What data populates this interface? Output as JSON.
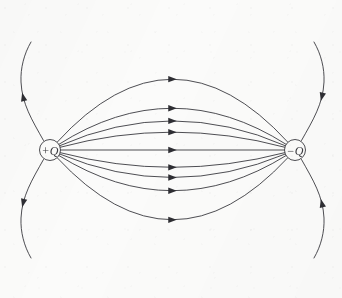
{
  "figure": {
    "name": "electric-dipole-field-lines",
    "background_color": "#fbfbfa",
    "ink_color": "#3a3a3f",
    "stroke_width": 0.9,
    "width": 342,
    "height": 298
  },
  "charges": {
    "positive": {
      "label": "+Q",
      "cx": 50,
      "cy": 150,
      "r": 10.5,
      "font_size": 12,
      "sign": "+",
      "name": "positive-charge"
    },
    "negative": {
      "label": "−Q",
      "cx": 295,
      "cy": 150,
      "r": 10.5,
      "font_size": 12,
      "sign": "−",
      "name": "negative-charge"
    }
  },
  "arrowhead": {
    "length": 8.5,
    "half_width": 3.2,
    "color": "#2e2e33"
  },
  "connecting_lines": [
    {
      "name": "arc-upper-4",
      "bulge": -134,
      "arrow_t": 0.5,
      "arrow_dir": "right"
    },
    {
      "name": "arc-upper-3",
      "bulge": -78,
      "arrow_t": 0.5,
      "arrow_dir": "right"
    },
    {
      "name": "arc-upper-2",
      "bulge": -54,
      "arrow_t": 0.5,
      "arrow_dir": "right"
    },
    {
      "name": "arc-upper-1",
      "bulge": -33,
      "arrow_t": 0.5,
      "arrow_dir": "right"
    },
    {
      "name": "arc-center",
      "bulge": 0,
      "arrow_t": 0.5,
      "arrow_dir": "right"
    },
    {
      "name": "arc-lower-1",
      "bulge": 32,
      "arrow_t": 0.5,
      "arrow_dir": "right"
    },
    {
      "name": "arc-lower-2",
      "bulge": 51,
      "arrow_t": 0.5,
      "arrow_dir": "right"
    },
    {
      "name": "arc-lower-3",
      "bulge": 76,
      "arrow_t": 0.5,
      "arrow_dir": "right"
    },
    {
      "name": "arc-lower-4",
      "bulge": 132,
      "arrow_t": 0.5,
      "arrow_dir": "right"
    }
  ],
  "outer_lines": [
    {
      "name": "outer-line-upper-left",
      "path": "M 43.5 140.5 C 32 120 22 104 21 82 C 20.4 68 24 54 31 42",
      "arrow_t": 0.46,
      "arrow_dir": "forward"
    },
    {
      "name": "outer-line-lower-left",
      "path": "M 43.5 159.5 C 32 180 22 196 21 218 C 20.4 232 24 246 31 258",
      "arrow_t": 0.46,
      "arrow_dir": "forward"
    },
    {
      "name": "outer-line-upper-right",
      "path": "M 314 42 C 321 54 324.6 68 324 82 C 323 104 313 120 301.5 140.5",
      "arrow_t": 0.54,
      "arrow_dir": "forward"
    },
    {
      "name": "outer-line-lower-right",
      "path": "M 314 258 C 321 246 324.6 232 324 218 C 323 196 313 180 301.5 159.5",
      "arrow_t": 0.54,
      "arrow_dir": "forward"
    }
  ]
}
